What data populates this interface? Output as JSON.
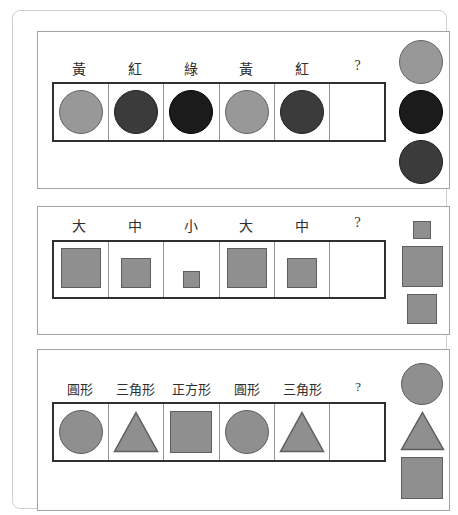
{
  "colors": {
    "card-border": "#cfcfcf",
    "panel-border": "#a3a3a3",
    "strip-border": "#303030",
    "cell-divider": "#949494",
    "label-text": "#2f2f2f",
    "shape-gray": "#8f8f8f",
    "shape-gray-border": "#5e5e5e",
    "circle-yellow": "#989898",
    "circle-yellow-border": "#646464",
    "circle-red": "#3b3b3b",
    "circle-red-border": "#1f1f1f",
    "circle-green": "#1b1b1b",
    "circle-green-border": "#000000"
  },
  "panels": [
    {
      "name": "color-pattern",
      "labels": [
        "黃",
        "紅",
        "綠",
        "黃",
        "紅",
        "?"
      ],
      "sequence": [
        "yellow-circle",
        "red-circle",
        "green-circle",
        "yellow-circle",
        "red-circle",
        "empty"
      ],
      "options": [
        "yellow-circle",
        "green-circle",
        "red-circle"
      ]
    },
    {
      "name": "size-pattern",
      "labels": [
        "大",
        "中",
        "小",
        "大",
        "中",
        "?"
      ],
      "sequence": [
        "large-square",
        "medium-square",
        "small-square",
        "large-square",
        "medium-square",
        "empty"
      ],
      "options": [
        "small-square",
        "large-square",
        "medium-square"
      ]
    },
    {
      "name": "shape-pattern",
      "labels": [
        "圓形",
        "三角形",
        "正方形",
        "圓形",
        "三角形",
        "?"
      ],
      "sequence": [
        "circle",
        "triangle",
        "square",
        "circle",
        "triangle",
        "empty"
      ],
      "options": [
        "circle",
        "triangle",
        "square"
      ]
    }
  ]
}
